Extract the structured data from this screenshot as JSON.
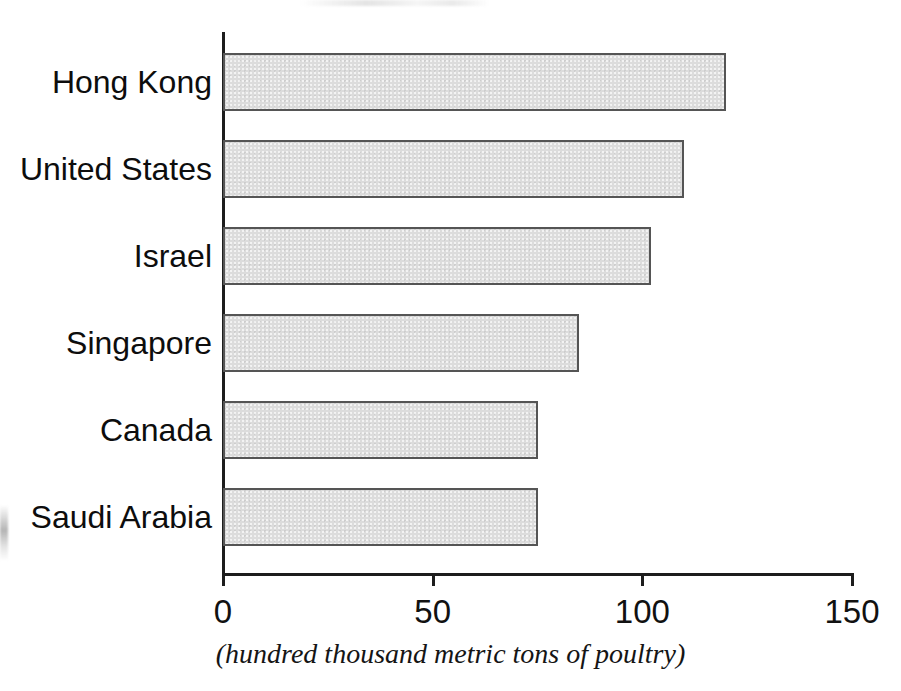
{
  "chart_data": {
    "type": "bar",
    "orientation": "horizontal",
    "title": "",
    "subtitle": "",
    "xlabel": "(hundred thousand metric tons of poultry)",
    "ylabel": "",
    "categories": [
      "Hong Kong",
      "United States",
      "Israel",
      "Singapore",
      "Canada",
      "Saudi Arabia"
    ],
    "values": [
      120,
      110,
      102,
      85,
      75,
      75
    ],
    "xlim": [
      0,
      150
    ],
    "xticks": [
      0,
      50,
      100,
      150
    ],
    "xtick_labels": [
      "0",
      "50",
      "100",
      "150"
    ],
    "grid": false,
    "legend": false,
    "legend_position": "none",
    "bar_fill_color": "#dcdcdc",
    "bar_border_color": "#555555",
    "axis_color": "#1d1d1d",
    "background_color": "#ffffff",
    "units": "hundred thousand metric tons of poultry"
  },
  "bars": [
    {
      "label": "Hong Kong",
      "value": 120
    },
    {
      "label": "United States",
      "value": 110
    },
    {
      "label": "Israel",
      "value": 102
    },
    {
      "label": "Singapore",
      "value": 85
    },
    {
      "label": "Canada",
      "value": 75
    },
    {
      "label": "Saudi Arabia",
      "value": 75
    }
  ],
  "axis": {
    "caption": "(hundred thousand metric tons of poultry)",
    "ticks": [
      {
        "value": 0,
        "label": "0"
      },
      {
        "value": 50,
        "label": "50"
      },
      {
        "value": 100,
        "label": "100"
      },
      {
        "value": 150,
        "label": "150"
      }
    ]
  }
}
